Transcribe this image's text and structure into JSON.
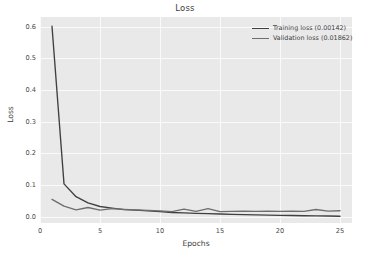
{
  "chart_data": {
    "type": "line",
    "title": "Loss",
    "xlabel": "Epochs",
    "ylabel": "Loss",
    "xlim": [
      0,
      26
    ],
    "ylim": [
      -0.02,
      0.63
    ],
    "grid": true,
    "legend_position": "upper right",
    "xticks": [
      "0",
      "5",
      "10",
      "15",
      "20",
      "25"
    ],
    "xtick_values": [
      0,
      5,
      10,
      15,
      20,
      25
    ],
    "yticks": [
      "0.0",
      "0.1",
      "0.2",
      "0.3",
      "0.4",
      "0.5",
      "0.6"
    ],
    "ytick_values": [
      0.0,
      0.1,
      0.2,
      0.3,
      0.4,
      0.5,
      0.6
    ],
    "x": [
      1,
      2,
      3,
      4,
      5,
      6,
      7,
      8,
      9,
      10,
      11,
      12,
      13,
      14,
      15,
      16,
      17,
      18,
      19,
      20,
      21,
      22,
      23,
      24,
      25
    ],
    "series": [
      {
        "name": "Training loss (0.00142)",
        "color": "#404040",
        "values": [
          0.601,
          0.1035,
          0.063,
          0.0435,
          0.032,
          0.0268,
          0.0222,
          0.0205,
          0.0185,
          0.016,
          0.0132,
          0.0118,
          0.0105,
          0.0095,
          0.0085,
          0.0072,
          0.0062,
          0.0055,
          0.0048,
          0.0042,
          0.0036,
          0.003,
          0.0025,
          0.002,
          0.0014
        ]
      },
      {
        "name": "Validation loss (0.01862)",
        "color": "#6e6e6e",
        "values": [
          0.0545,
          0.033,
          0.0215,
          0.029,
          0.0205,
          0.0252,
          0.023,
          0.0215,
          0.02,
          0.0182,
          0.016,
          0.0235,
          0.0165,
          0.0255,
          0.016,
          0.0168,
          0.0172,
          0.0168,
          0.017,
          0.0166,
          0.0172,
          0.0168,
          0.0225,
          0.0175,
          0.0186
        ]
      }
    ]
  },
  "legend": {
    "entries": [
      {
        "label": "Training loss (0.00142)"
      },
      {
        "label": "Validation loss (0.01862)"
      }
    ]
  }
}
